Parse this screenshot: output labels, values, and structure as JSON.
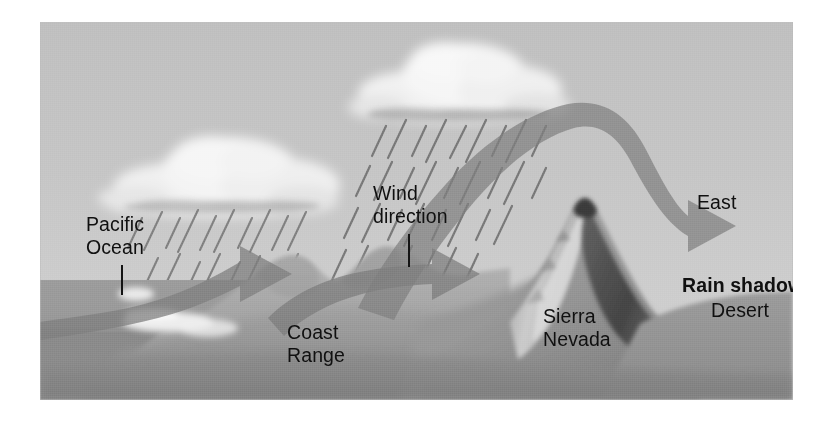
{
  "figure": {
    "background_color": "#c3c3c3",
    "sky_color": "#c6c6c6",
    "ink_color": "#101010",
    "arrow_color": "#8a8a8a",
    "rain_color": "#6e6e6e"
  },
  "labels": {
    "pacific_ocean": "Pacific\nOcean",
    "wind_direction": "Wind\ndirection",
    "coast_range": "Coast\nRange",
    "sierra_nevada": "Sierra\nNevada",
    "east": "East",
    "rain_shadow": "Rain shadow",
    "desert": "Desert"
  },
  "elements": {
    "cloud_west": "cloud-icon",
    "cloud_sierra": "cloud-icon",
    "rain_west": "rain-streaks",
    "rain_sierra": "rain-streaks",
    "arrow_ocean": "wind-arrow",
    "arrow_valley": "wind-arrow",
    "arrow_leeward": "wind-arrow",
    "terrain_coast_range": "mountain-range",
    "terrain_sierra_nevada": "mountain-peak",
    "ocean_surface": "water-body",
    "desert_floor": "desert-plain"
  },
  "diagram_data": {
    "type": "cross-section",
    "orientation": "west-to-east",
    "features": [
      {
        "name": "Pacific Ocean",
        "position": "far west",
        "role": "moisture source"
      },
      {
        "name": "Coast Range",
        "position": "west",
        "role": "first orographic barrier"
      },
      {
        "name": "Central Valley",
        "position": "middle",
        "role": "between ranges"
      },
      {
        "name": "Sierra Nevada",
        "position": "east",
        "role": "main orographic barrier"
      },
      {
        "name": "Rain shadow Desert",
        "position": "far east",
        "role": "leeward dry zone"
      }
    ],
    "precipitation": [
      {
        "over": "Coast Range",
        "intensity": "moderate"
      },
      {
        "over": "Sierra Nevada windward slope",
        "intensity": "heavy"
      },
      {
        "over": "Desert",
        "intensity": "none"
      }
    ]
  }
}
